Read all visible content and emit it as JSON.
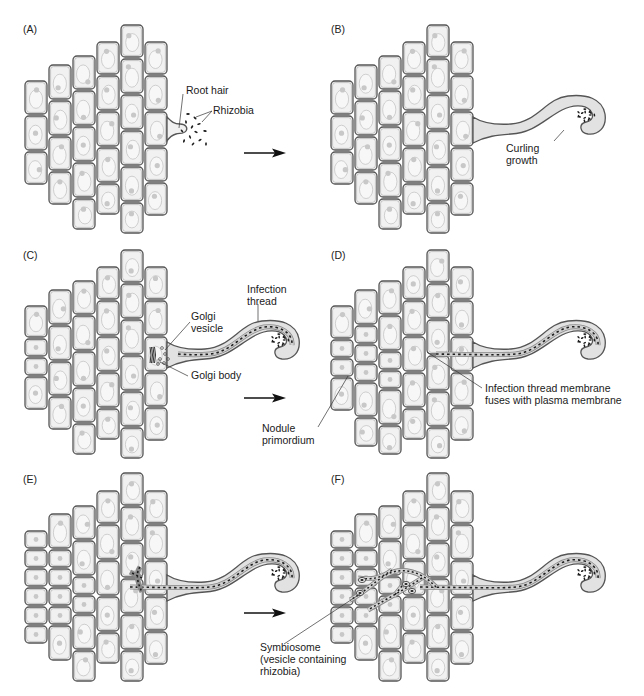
{
  "figure": {
    "colors": {
      "cell_fill": "#f1f1f1",
      "cell_stroke": "#555555",
      "cell_inner": "#d9d9d9",
      "nucleus": "#c8c8c8",
      "bacteria": "#1e1e1e",
      "thread_fill": "#e2e2e2",
      "text": "#1a1a1a",
      "background": "#ffffff"
    },
    "panels": [
      {
        "id": "A",
        "label": "(A)",
        "callouts": [
          {
            "name": "root-hair-label",
            "lines": [
              "Root hair"
            ]
          },
          {
            "name": "rhizobia-label",
            "lines": [
              "Rhizobia"
            ]
          }
        ],
        "has_arrow": true
      },
      {
        "id": "B",
        "label": "(B)",
        "callouts": [
          {
            "name": "curling-growth-label",
            "lines": [
              "Curling",
              "growth"
            ]
          }
        ],
        "has_arrow": false
      },
      {
        "id": "C",
        "label": "(C)",
        "callouts": [
          {
            "name": "infection-thread-label",
            "lines": [
              "Infection",
              "thread"
            ]
          },
          {
            "name": "golgi-vesicle-label",
            "lines": [
              "Golgi",
              "vesicle"
            ]
          },
          {
            "name": "golgi-body-label",
            "lines": [
              "Golgi body"
            ]
          }
        ],
        "has_arrow": true
      },
      {
        "id": "D",
        "label": "(D)",
        "callouts": [
          {
            "name": "nodule-primordium-label",
            "lines": [
              "Nodule",
              "primordium"
            ]
          },
          {
            "name": "membrane-fusion-label",
            "lines": [
              "Infection thread membrane",
              "fuses with plasma membrane"
            ]
          }
        ],
        "has_arrow": false
      },
      {
        "id": "E",
        "label": "(E)",
        "callouts": [
          {
            "name": "symbiosome-label",
            "lines": [
              "Symbiosome",
              "(vesicle containing",
              "rhizobia)"
            ]
          }
        ],
        "has_arrow": true
      },
      {
        "id": "F",
        "label": "(F)",
        "callouts": [],
        "has_arrow": false
      }
    ]
  }
}
